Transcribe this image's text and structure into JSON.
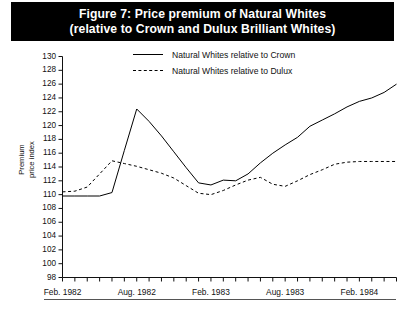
{
  "figure": {
    "title_line1": "Figure 7: Price premium of Natural Whites",
    "title_line2": "(relative to Crown and Dulux Brilliant Whites)",
    "title_bg": "#000000",
    "title_fg": "#ffffff"
  },
  "legend": {
    "position": "top-center",
    "items": [
      {
        "label": "Natural Whites relative to Crown",
        "style": "solid",
        "color": "#000000"
      },
      {
        "label": "Natural Whites relative to Dulux",
        "style": "dashed",
        "color": "#000000"
      }
    ]
  },
  "axes": {
    "ylabel_line1": "Premium",
    "ylabel_line2": "price index",
    "yticks": [
      130,
      128,
      126,
      124,
      122,
      120,
      118,
      116,
      114,
      112,
      110,
      108,
      106,
      104,
      102,
      100,
      98
    ],
    "ymin": 98,
    "ymax": 130,
    "xticks_labeled": [
      "Feb. 1982",
      "Aug. 1982",
      "Feb. 1983",
      "Aug. 1983",
      "Feb. 1984"
    ],
    "xtick_count_minor": 28
  },
  "chart_data": {
    "type": "line",
    "title": "Figure 7: Price premium of Natural Whites (relative to Crown and Dulux Brilliant Whites)",
    "xlabel": "",
    "ylabel": "Premium price index",
    "ylim": [
      98,
      130
    ],
    "grid": false,
    "legend_position": "top-center",
    "x": [
      "Feb. 1982",
      "Mar. 1982",
      "Apr. 1982",
      "May 1982",
      "Jun. 1982",
      "Jul. 1982",
      "Aug. 1982",
      "Sep. 1982",
      "Oct. 1982",
      "Nov. 1982",
      "Dec. 1982",
      "Jan. 1983",
      "Feb. 1983",
      "Mar. 1983",
      "Apr. 1983",
      "May 1983",
      "Jun. 1983",
      "Jul. 1983",
      "Aug. 1983",
      "Sep. 1983",
      "Oct. 1983",
      "Nov. 1983",
      "Dec. 1983",
      "Jan. 1984",
      "Feb. 1984",
      "Mar. 1984",
      "Apr. 1984",
      "May 1984"
    ],
    "series": [
      {
        "name": "Natural Whites relative to Crown",
        "style": "solid",
        "color": "#000000",
        "values": [
          109.8,
          109.8,
          109.8,
          109.8,
          110.3,
          116.4,
          122.4,
          120.6,
          118.5,
          116.2,
          113.9,
          111.7,
          111.4,
          112.1,
          112.0,
          113.0,
          114.6,
          116.0,
          117.2,
          118.3,
          119.9,
          120.8,
          121.7,
          122.7,
          123.5,
          124.0,
          124.8,
          126.0
        ]
      },
      {
        "name": "Natural Whites relative to Dulux",
        "style": "dashed",
        "color": "#000000",
        "values": [
          110.4,
          110.5,
          111.1,
          113.0,
          114.9,
          114.5,
          114.1,
          113.6,
          113.1,
          112.4,
          111.3,
          110.2,
          110.0,
          110.6,
          111.4,
          112.1,
          112.5,
          111.5,
          111.2,
          112.0,
          112.9,
          113.6,
          114.4,
          114.7,
          114.8,
          114.8,
          114.8,
          114.8
        ]
      }
    ]
  }
}
